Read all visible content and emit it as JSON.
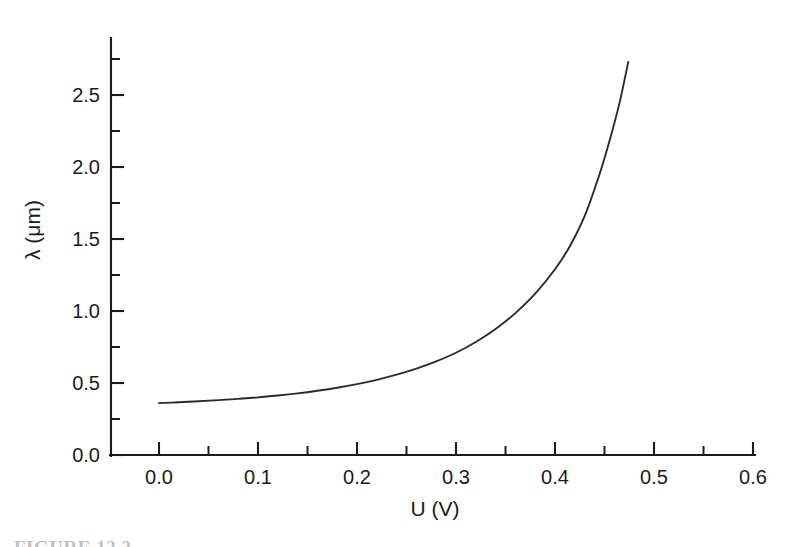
{
  "figure": {
    "caption_partial": "FIGURE 12.2",
    "background_color": "#ffffff",
    "line_color": "#2b2b2b",
    "axis_color": "#1a1a1a"
  },
  "chart_data": {
    "type": "line",
    "title": "",
    "xlabel": "U (V)",
    "ylabel": "λ (μm)",
    "xlim": [
      -0.03,
      0.63
    ],
    "ylim": [
      0.0,
      2.78
    ],
    "grid": false,
    "legend": null,
    "x_ticks_major": [
      0.0,
      0.1,
      0.2,
      0.3,
      0.4,
      0.5,
      0.6
    ],
    "x_tick_labels": [
      "0.0",
      "0.1",
      "0.2",
      "0.3",
      "0.4",
      "0.5",
      "0.6"
    ],
    "x_ticks_minor": [
      0.05,
      0.15,
      0.25,
      0.35,
      0.45,
      0.55
    ],
    "y_ticks_major": [
      0.0,
      0.5,
      1.0,
      1.5,
      2.0,
      2.5
    ],
    "y_tick_labels": [
      "0.0",
      "0.5",
      "1.0",
      "1.5",
      "2.0",
      "2.5"
    ],
    "y_ticks_minor": [
      0.25,
      0.75,
      1.25,
      1.75,
      2.25,
      2.75
    ],
    "tick_direction": "in",
    "series": [
      {
        "name": "wavelength-vs-voltage",
        "x": [
          0.0,
          0.02,
          0.04,
          0.06,
          0.08,
          0.1,
          0.12,
          0.14,
          0.16,
          0.18,
          0.2,
          0.22,
          0.24,
          0.26,
          0.28,
          0.3,
          0.32,
          0.34,
          0.36,
          0.38,
          0.4,
          0.415,
          0.43,
          0.445,
          0.455,
          0.465,
          0.474
        ],
        "y": [
          0.36,
          0.366,
          0.373,
          0.381,
          0.39,
          0.4,
          0.413,
          0.428,
          0.446,
          0.467,
          0.492,
          0.522,
          0.558,
          0.6,
          0.65,
          0.71,
          0.785,
          0.875,
          0.985,
          1.12,
          1.29,
          1.45,
          1.66,
          1.95,
          2.18,
          2.44,
          2.73
        ]
      }
    ]
  },
  "axes": {
    "x_axis_name": "x-axis",
    "y_axis_name": "y-axis"
  }
}
